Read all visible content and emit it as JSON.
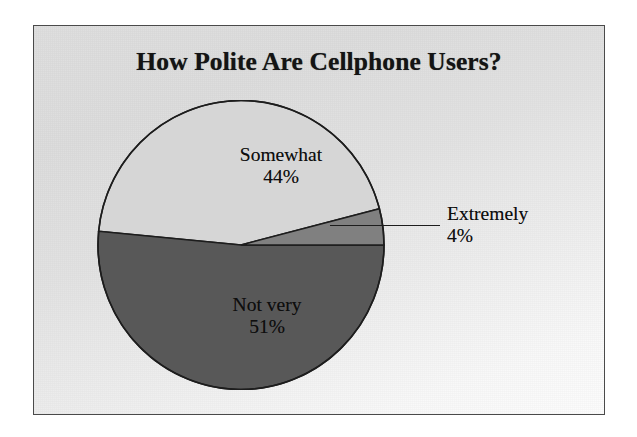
{
  "chart_data": {
    "type": "pie",
    "title": "How Polite Are Cellphone Users?",
    "categories": [
      "Extremely",
      "Somewhat",
      "Not very"
    ],
    "values": [
      4,
      44,
      51
    ],
    "labels": [
      "4%",
      "44%",
      "51%"
    ],
    "legend": "none",
    "grid": false,
    "slices": [
      {
        "name": "Extremely",
        "value": 4,
        "percent_label": "4%",
        "color": "#808080",
        "label_placement": "outside-right-with-leader"
      },
      {
        "name": "Somewhat",
        "value": 44,
        "percent_label": "44%",
        "color": "#d6d6d6",
        "label_placement": "inside"
      },
      {
        "name": "Not very",
        "value": 51,
        "percent_label": "51%",
        "color": "#585858",
        "label_placement": "inside"
      }
    ],
    "start_angle_deg": 0,
    "direction": "counterclockwise",
    "xlabel": "",
    "ylabel": ""
  },
  "chart": {
    "title": "How Polite Are Cellphone Users?",
    "labels": {
      "somewhat": {
        "name": "Somewhat",
        "pct": "44%"
      },
      "not_very": {
        "name": "Not very",
        "pct": "51%"
      },
      "extremely": {
        "name": "Extremely",
        "pct": "4%"
      }
    },
    "colors": {
      "somewhat": "#d6d6d6",
      "not_very": "#585858",
      "extremely": "#808080",
      "outline": "#1d1d1d",
      "frame": "#4a4a4a",
      "plate_background": "#dcdcdc",
      "text": "#0e0e0e"
    }
  }
}
